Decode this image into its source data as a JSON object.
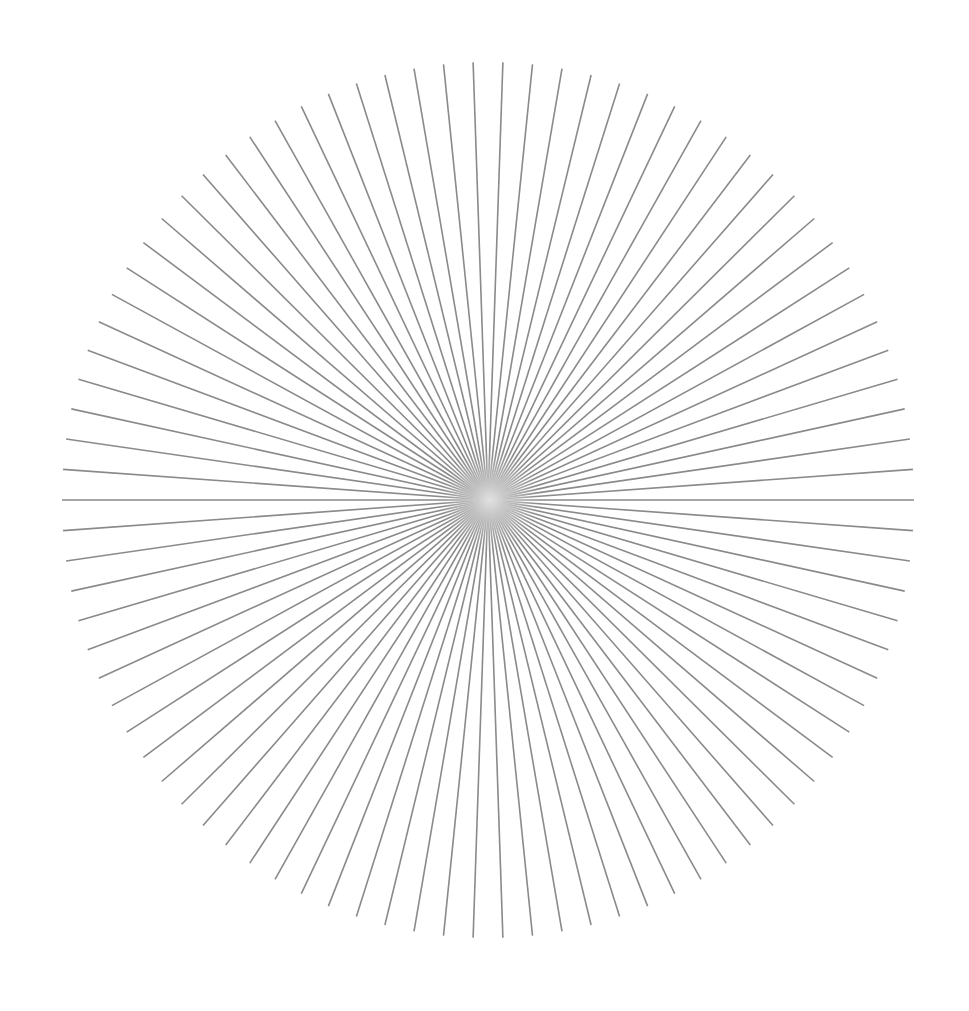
{
  "figure": {
    "type": "starburst",
    "line_count": 90,
    "angle_step_deg": 4,
    "center": {
      "x": 488,
      "y": 500
    },
    "radius_x": 426,
    "radius_y": 438,
    "line_color": "#8a8a8a",
    "line_width": 1.6,
    "center_glow_color": "#e6e6e6",
    "background": "#ffffff"
  }
}
